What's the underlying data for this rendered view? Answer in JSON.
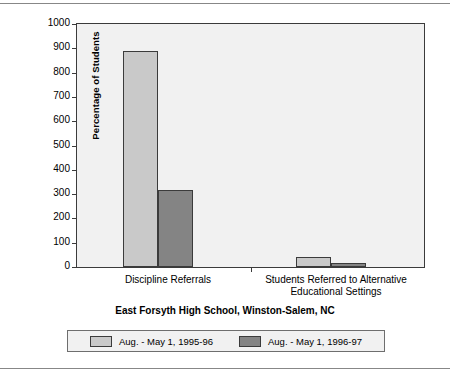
{
  "chart_data": {
    "type": "bar",
    "title": "East Forsyth High School, Winston-Salem, NC",
    "xlabel": "",
    "ylabel": "Percentage of Students",
    "ylim": [
      0,
      1000
    ],
    "yticks": [
      0,
      100,
      200,
      300,
      400,
      500,
      600,
      700,
      800,
      900,
      1000
    ],
    "grid": false,
    "legend_position": "bottom",
    "categories": [
      "Discipline Referrals",
      "Students Referred to Alternative Educational Settings"
    ],
    "series": [
      {
        "name": "Aug. - May 1, 1995-96",
        "color": "#c9c9c9",
        "values": [
          888,
          43
        ]
      },
      {
        "name": "Aug. - May 1, 1996-97",
        "color": "#848484",
        "values": [
          315,
          18
        ]
      }
    ]
  },
  "figure": {
    "plot_background": "#f1f1f1",
    "frame_color": "#3b3b3b",
    "rule_color": "#878787"
  }
}
